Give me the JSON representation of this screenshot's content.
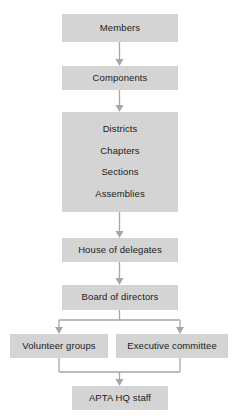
{
  "diagram": {
    "type": "organizational-flowchart",
    "orientation": "top-to-bottom",
    "node_fill_color": "#d4d4d4",
    "connector_color": "#a6a6a6",
    "text_color": "#1b1b1b",
    "background_color": "#ffffff",
    "nodes": [
      {
        "id": "members",
        "label": "Members"
      },
      {
        "id": "components",
        "label": "Components"
      },
      {
        "id": "component-types",
        "label": "Districts Chapters Sections Assemblies",
        "lines": [
          "Districts",
          "Chapters",
          "Sections",
          "Assemblies"
        ]
      },
      {
        "id": "house-of-delegates",
        "label": "House of delegates"
      },
      {
        "id": "board-of-directors",
        "label": "Board of directors"
      },
      {
        "id": "volunteer-groups",
        "label": "Volunteer groups"
      },
      {
        "id": "executive-committee",
        "label": "Executive committee"
      },
      {
        "id": "apta-hq-staff",
        "label": "APTA HQ staff"
      }
    ],
    "edges": [
      {
        "from": "members",
        "to": "components"
      },
      {
        "from": "components",
        "to": "component-types"
      },
      {
        "from": "component-types",
        "to": "house-of-delegates"
      },
      {
        "from": "house-of-delegates",
        "to": "board-of-directors"
      },
      {
        "from": "board-of-directors",
        "to": "volunteer-groups"
      },
      {
        "from": "board-of-directors",
        "to": "executive-committee"
      },
      {
        "from": "volunteer-groups",
        "to": "apta-hq-staff"
      },
      {
        "from": "executive-committee",
        "to": "apta-hq-staff"
      }
    ]
  }
}
